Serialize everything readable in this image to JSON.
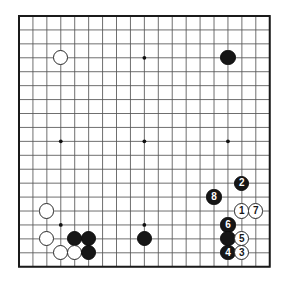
{
  "board": {
    "type": "go-board",
    "size": 19,
    "grid_color": "#555555",
    "border_color": "#1a1a1a",
    "background_color": "#ffffff",
    "black_color": "#161616",
    "white_color": "#ffffff",
    "star_points": [
      {
        "col": 3,
        "row": 3
      },
      {
        "col": 9,
        "row": 3
      },
      {
        "col": 15,
        "row": 3
      },
      {
        "col": 3,
        "row": 9
      },
      {
        "col": 9,
        "row": 9
      },
      {
        "col": 15,
        "row": 9
      },
      {
        "col": 3,
        "row": 15
      },
      {
        "col": 9,
        "row": 15
      },
      {
        "col": 15,
        "row": 15
      }
    ],
    "stones": [
      {
        "id": "w-upper-left",
        "color": "white",
        "col": 3,
        "row": 3,
        "label": ""
      },
      {
        "id": "b-upper-right",
        "color": "black",
        "col": 15,
        "row": 3,
        "label": ""
      },
      {
        "id": "w-lower-left-a",
        "color": "white",
        "col": 2,
        "row": 14,
        "label": ""
      },
      {
        "id": "w-lower-left-b",
        "color": "white",
        "col": 2,
        "row": 16,
        "label": ""
      },
      {
        "id": "b-lower-left-a",
        "color": "black",
        "col": 4,
        "row": 16,
        "label": ""
      },
      {
        "id": "b-lower-left-b",
        "color": "black",
        "col": 5,
        "row": 16,
        "label": ""
      },
      {
        "id": "w-lower-left-c",
        "color": "white",
        "col": 3,
        "row": 17,
        "label": ""
      },
      {
        "id": "w-lower-left-d",
        "color": "white",
        "col": 4,
        "row": 17,
        "label": ""
      },
      {
        "id": "b-lower-left-c",
        "color": "black",
        "col": 5,
        "row": 17,
        "label": ""
      },
      {
        "id": "b-lower-center",
        "color": "black",
        "col": 9,
        "row": 16,
        "label": ""
      },
      {
        "id": "move-2",
        "color": "black",
        "col": 16,
        "row": 12,
        "label": "2"
      },
      {
        "id": "move-8",
        "color": "black",
        "col": 14,
        "row": 13,
        "label": "8"
      },
      {
        "id": "move-1",
        "color": "white",
        "col": 16,
        "row": 14,
        "label": "1"
      },
      {
        "id": "move-7",
        "color": "white",
        "col": 17,
        "row": 14,
        "label": "7"
      },
      {
        "id": "move-6",
        "color": "black",
        "col": 15,
        "row": 15,
        "label": "6"
      },
      {
        "id": "b-right-plain",
        "color": "black",
        "col": 15,
        "row": 16,
        "label": ""
      },
      {
        "id": "move-5",
        "color": "white",
        "col": 16,
        "row": 16,
        "label": "5"
      },
      {
        "id": "move-4",
        "color": "black",
        "col": 15,
        "row": 17,
        "label": "4"
      },
      {
        "id": "move-3",
        "color": "white",
        "col": 16,
        "row": 17,
        "label": "3"
      }
    ]
  }
}
